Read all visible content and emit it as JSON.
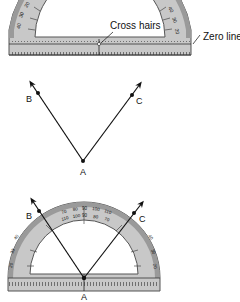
{
  "figure": {
    "type": "protractor-angle-measurement",
    "colors": {
      "protractor_fill": "#c8c8c8",
      "protractor_edge": "#555555",
      "protractor_dark_rim": "#8a8a8a",
      "line": "#111111",
      "background": "#ffffff"
    }
  },
  "panel_top": {
    "annotations": [
      {
        "id": "cross-hairs",
        "text": "Cross hairs"
      },
      {
        "id": "zero-line",
        "text": "Zero line"
      }
    ],
    "scale_labels_left": [
      "20",
      "30",
      "40"
    ],
    "scale_labels_right": [
      "40",
      "30",
      "20"
    ]
  },
  "panel_middle": {
    "vertex_label": "A",
    "ray1_label": "B",
    "ray2_label": "C"
  },
  "panel_bottom": {
    "vertex_label": "A",
    "ray1_label": "B",
    "ray2_label": "C",
    "scale_labels_top": [
      "70",
      "80",
      "90",
      "100",
      "110"
    ],
    "scale_labels_inner": [
      "110",
      "100",
      "90",
      "80",
      "70"
    ]
  }
}
